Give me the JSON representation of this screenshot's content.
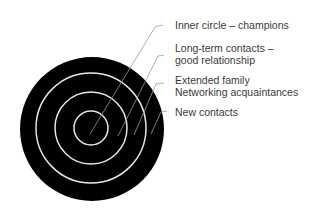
{
  "diagram": {
    "type": "concentric-circles",
    "colors": {
      "fill": "#000000",
      "ring": "#e6e6e6",
      "leader": "#9a9a9a",
      "text": "#3a3a3a"
    },
    "labels": [
      {
        "line1": "Inner circle – champions",
        "line2": ""
      },
      {
        "line1": "Long-term contacts –",
        "line2": "good relationship"
      },
      {
        "line1": "Extended family",
        "line2": "Networking acquaintances"
      },
      {
        "line1": "New contacts",
        "line2": ""
      }
    ]
  }
}
